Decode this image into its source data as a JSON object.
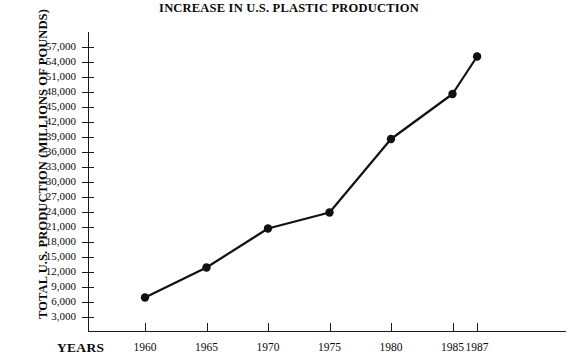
{
  "chart_data": {
    "type": "line",
    "title": "INCREASE IN U.S. PLASTIC PRODUCTION",
    "xlabel": "YEARS",
    "ylabel": "TOTAL U.S. PRODUCTION (MILLIONS OF POUNDS)",
    "x": [
      1960,
      1965,
      1970,
      1975,
      1980,
      1985,
      1987
    ],
    "xtick_labels": [
      "1960",
      "1965",
      "1970",
      "1975",
      "1980",
      "1985",
      "1987"
    ],
    "values": [
      6800,
      12800,
      20600,
      23800,
      38500,
      47500,
      55000
    ],
    "ytick_values": [
      3000,
      6000,
      9000,
      12000,
      15000,
      18000,
      21000,
      24000,
      27000,
      30000,
      33000,
      36000,
      39000,
      42000,
      45000,
      48000,
      51000,
      54000,
      57000
    ],
    "ytick_labels": [
      "3,000",
      "6,000",
      "9,000",
      "12,000",
      "15,000",
      "18,000",
      "21,000",
      "24,000",
      "27,000",
      "30,000",
      "33,000",
      "36,000",
      "39,000",
      "42,000",
      "45,000",
      "48,000",
      "51,000",
      "54,000",
      "57,000"
    ],
    "ylim": [
      0,
      60000
    ],
    "xlim": [
      1958.5,
      1988.5
    ],
    "grid": false,
    "legend": null,
    "marker": "filled-circle",
    "line_color": "#111111",
    "axis_color": "#1a1a1a",
    "background": "#ffffff"
  }
}
